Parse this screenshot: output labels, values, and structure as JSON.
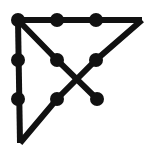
{
  "figure": {
    "canvas": {
      "width": 156,
      "height": 158,
      "background": "#ffffff"
    },
    "style": {
      "stroke_color": "#111111",
      "node_color": "#111111",
      "stroke_width": 6,
      "node_radius": 7
    }
  },
  "chart_data": {
    "type": "scatter",
    "xlabel": "",
    "ylabel": "",
    "grid": false,
    "legend": "none",
    "xlim": [
      0,
      156
    ],
    "ylim": [
      158,
      0
    ],
    "nodes": [
      {
        "id": "n1",
        "label": "top-left",
        "x": 18,
        "y": 20,
        "marker": "dot"
      },
      {
        "id": "n2",
        "label": "top-mid",
        "x": 57,
        "y": 20,
        "marker": "dot"
      },
      {
        "id": "n3",
        "label": "top-right-inner",
        "x": 96,
        "y": 20,
        "marker": "dot"
      },
      {
        "id": "n4",
        "label": "left-upper",
        "x": 18,
        "y": 60,
        "marker": "dot"
      },
      {
        "id": "n5",
        "label": "center-left",
        "x": 57,
        "y": 60,
        "marker": "dot"
      },
      {
        "id": "n6",
        "label": "center-right",
        "x": 96,
        "y": 60,
        "marker": "dot"
      },
      {
        "id": "n7",
        "label": "left-lower",
        "x": 18,
        "y": 99,
        "marker": "dot"
      },
      {
        "id": "n8",
        "label": "bottom-mid",
        "x": 57,
        "y": 99,
        "marker": "dot"
      },
      {
        "id": "n9",
        "label": "bottom-right-end",
        "x": 97,
        "y": 99,
        "marker": "dot"
      },
      {
        "id": "v1",
        "label": "apex-right",
        "x": 142,
        "y": 20,
        "marker": "none"
      },
      {
        "id": "v2",
        "label": "apex-bottom",
        "x": 20,
        "y": 143,
        "marker": "none"
      }
    ],
    "edges": [
      {
        "from": "n1",
        "to": "v1",
        "path": [
          [
            18,
            20
          ],
          [
            142,
            20
          ]
        ],
        "name": "top-edge"
      },
      {
        "from": "n1",
        "to": "v2",
        "path": [
          [
            18,
            20
          ],
          [
            20,
            143
          ]
        ],
        "name": "left-edge"
      },
      {
        "from": "n1",
        "to": "n9",
        "path": [
          [
            18,
            20
          ],
          [
            57,
            60
          ],
          [
            97,
            99
          ]
        ],
        "name": "diagonal-down-right"
      },
      {
        "from": "v1",
        "to": "v2",
        "path": [
          [
            142,
            20
          ],
          [
            96,
            60
          ],
          [
            57,
            99
          ],
          [
            20,
            143
          ]
        ],
        "name": "hypotenuse-diagonal"
      }
    ],
    "crossing_points": [
      [
        77,
        80
      ]
    ]
  }
}
